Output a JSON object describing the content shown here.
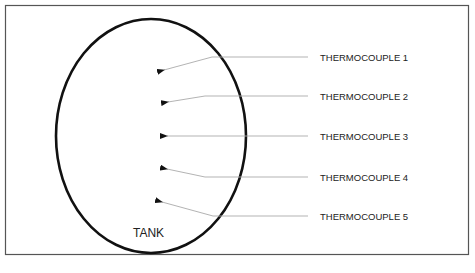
{
  "diagram": {
    "tank_label": "TANK",
    "thermocouples": [
      {
        "label": "THERMOCOUPLE 1"
      },
      {
        "label": "THERMOCOUPLE 2"
      },
      {
        "label": "THERMOCOUPLE 3"
      },
      {
        "label": "THERMOCOUPLE 4"
      },
      {
        "label": "THERMOCOUPLE 5"
      }
    ],
    "colors": {
      "frame": "#555555",
      "tank_outline": "#111111",
      "leader_line": "#aaaaaa",
      "arrowhead": "#111111",
      "text": "#222222"
    }
  },
  "caption": {
    "text": ""
  }
}
